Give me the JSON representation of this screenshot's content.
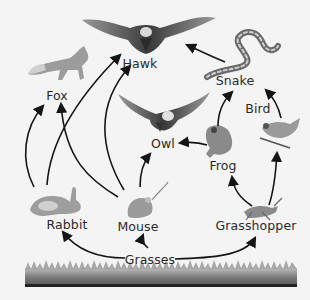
{
  "diagram": {
    "type": "food_web",
    "background": "#f4f4f4",
    "arrow_color": "#151515",
    "nodes": [
      {
        "id": "hawk",
        "label": "Hawk",
        "x": 140,
        "y": 63
      },
      {
        "id": "fox",
        "label": "Fox",
        "x": 57,
        "y": 95
      },
      {
        "id": "snake",
        "label": "Snake",
        "x": 235,
        "y": 80
      },
      {
        "id": "bird",
        "label": "Bird",
        "x": 258,
        "y": 108
      },
      {
        "id": "owl",
        "label": "Owl",
        "x": 163,
        "y": 143
      },
      {
        "id": "frog",
        "label": "Frog",
        "x": 223,
        "y": 165
      },
      {
        "id": "rabbit",
        "label": "Rabbit",
        "x": 67,
        "y": 224
      },
      {
        "id": "mouse",
        "label": "Mouse",
        "x": 138,
        "y": 226
      },
      {
        "id": "grasshopper",
        "label": "Grasshopper",
        "x": 256,
        "y": 225
      },
      {
        "id": "grasses",
        "label": "Grasses",
        "x": 150,
        "y": 259
      }
    ],
    "edges": [
      {
        "from": "grasses",
        "to": "rabbit"
      },
      {
        "from": "grasses",
        "to": "mouse"
      },
      {
        "from": "grasses",
        "to": "grasshopper"
      },
      {
        "from": "rabbit",
        "to": "fox"
      },
      {
        "from": "rabbit",
        "to": "hawk"
      },
      {
        "from": "mouse",
        "to": "fox"
      },
      {
        "from": "mouse",
        "to": "hawk"
      },
      {
        "from": "mouse",
        "to": "owl"
      },
      {
        "from": "grasshopper",
        "to": "frog"
      },
      {
        "from": "grasshopper",
        "to": "bird"
      },
      {
        "from": "frog",
        "to": "owl"
      },
      {
        "from": "frog",
        "to": "snake"
      },
      {
        "from": "bird",
        "to": "snake"
      },
      {
        "from": "snake",
        "to": "hawk"
      }
    ],
    "illustrations": [
      {
        "id": "hawk",
        "icon": "hawk-icon"
      },
      {
        "id": "fox",
        "icon": "fox-icon"
      },
      {
        "id": "snake",
        "icon": "snake-icon"
      },
      {
        "id": "bird",
        "icon": "bird-icon"
      },
      {
        "id": "owl",
        "icon": "owl-icon"
      },
      {
        "id": "frog",
        "icon": "frog-icon"
      },
      {
        "id": "rabbit",
        "icon": "rabbit-icon"
      },
      {
        "id": "mouse",
        "icon": "mouse-icon"
      },
      {
        "id": "grasshopper",
        "icon": "grasshopper-icon"
      },
      {
        "id": "grasses",
        "icon": "grass-strip-icon"
      }
    ]
  }
}
